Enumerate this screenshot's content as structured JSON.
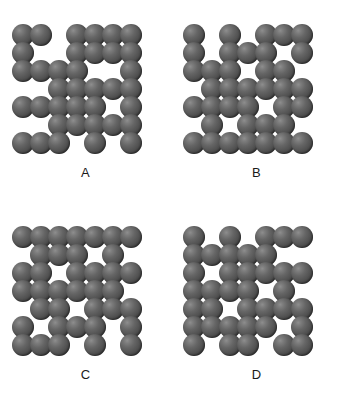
{
  "figure": {
    "background_color": "#ffffff",
    "sphere_color": "#555555",
    "sphere_highlight_color": "#8e8e8e",
    "label_color": "#1a1a1a",
    "grid_columns": 7,
    "grid_rows": 7,
    "cell_size_px": 18,
    "sphere_diameter_px": 22
  },
  "panels": [
    {
      "id": "A",
      "label": "A",
      "position": {
        "left": 0,
        "top": 0
      },
      "sphere_count": 36,
      "occupancy": [
        [
          1,
          1,
          0,
          1,
          1,
          1,
          1
        ],
        [
          1,
          0,
          0,
          1,
          1,
          1,
          1
        ],
        [
          1,
          1,
          1,
          1,
          0,
          0,
          1
        ],
        [
          0,
          0,
          1,
          1,
          1,
          1,
          1
        ],
        [
          1,
          1,
          1,
          1,
          1,
          0,
          1
        ],
        [
          0,
          0,
          1,
          1,
          1,
          1,
          1
        ],
        [
          1,
          1,
          1,
          0,
          1,
          0,
          1
        ]
      ]
    },
    {
      "id": "B",
      "label": "B",
      "position": {
        "left": 171,
        "top": 0
      },
      "sphere_count": 35,
      "occupancy": [
        [
          1,
          0,
          1,
          0,
          1,
          1,
          1
        ],
        [
          1,
          0,
          1,
          1,
          1,
          0,
          1
        ],
        [
          1,
          1,
          1,
          0,
          1,
          1,
          0
        ],
        [
          0,
          1,
          1,
          1,
          1,
          1,
          1
        ],
        [
          1,
          1,
          1,
          1,
          0,
          1,
          1
        ],
        [
          0,
          1,
          0,
          1,
          1,
          1,
          0
        ],
        [
          1,
          1,
          1,
          1,
          1,
          1,
          1
        ]
      ]
    },
    {
      "id": "C",
      "label": "C",
      "position": {
        "left": 0,
        "top": 202
      },
      "sphere_count": 38,
      "occupancy": [
        [
          1,
          1,
          1,
          1,
          1,
          1,
          1
        ],
        [
          0,
          1,
          1,
          1,
          0,
          1,
          0
        ],
        [
          1,
          1,
          0,
          1,
          1,
          1,
          1
        ],
        [
          1,
          1,
          1,
          1,
          1,
          1,
          0
        ],
        [
          0,
          1,
          1,
          0,
          1,
          1,
          1
        ],
        [
          1,
          0,
          1,
          1,
          1,
          0,
          1
        ],
        [
          1,
          1,
          1,
          0,
          1,
          0,
          1
        ]
      ]
    },
    {
      "id": "D",
      "label": "D",
      "position": {
        "left": 171,
        "top": 202
      },
      "sphere_count": 36,
      "occupancy": [
        [
          1,
          0,
          1,
          0,
          1,
          1,
          1
        ],
        [
          1,
          1,
          1,
          1,
          1,
          0,
          0
        ],
        [
          1,
          0,
          1,
          1,
          1,
          1,
          1
        ],
        [
          1,
          1,
          1,
          1,
          0,
          1,
          0
        ],
        [
          1,
          1,
          0,
          1,
          1,
          1,
          1
        ],
        [
          1,
          1,
          1,
          1,
          1,
          0,
          1
        ],
        [
          1,
          0,
          1,
          1,
          0,
          1,
          1
        ]
      ]
    }
  ]
}
